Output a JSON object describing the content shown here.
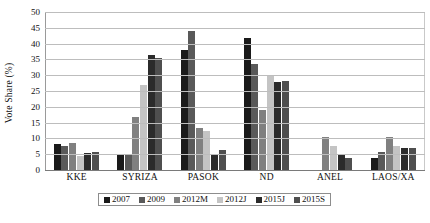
{
  "chart_data": {
    "type": "bar",
    "title": "",
    "subtitle": "",
    "xlabel": "",
    "ylabel": "Vote Share (%)",
    "ylim": [
      0,
      50
    ],
    "ytick_step": 5,
    "yticks": [
      "50",
      "45",
      "40",
      "35",
      "30",
      "25",
      "20",
      "15",
      "10",
      "5",
      "0"
    ],
    "grid": "horizontal",
    "legend_position": "bottom",
    "categories": [
      "KKE",
      "SYRIZA",
      "PASOK",
      "ND",
      "ANEL",
      "LAOS/XA"
    ],
    "series": [
      {
        "name": "2007",
        "color": "#1a1a1a",
        "values": [
          8.2,
          5.0,
          38.1,
          41.8,
          0.0,
          3.8
        ]
      },
      {
        "name": "2009",
        "color": "#595959",
        "values": [
          7.5,
          4.6,
          43.9,
          33.5,
          0.0,
          5.6
        ]
      },
      {
        "name": "2012M",
        "color": "#808080",
        "values": [
          8.5,
          16.8,
          13.2,
          18.9,
          10.6,
          10.6
        ]
      },
      {
        "name": "2012J",
        "color": "#c4c4c4",
        "values": [
          4.5,
          26.9,
          12.3,
          29.7,
          7.5,
          7.5
        ]
      },
      {
        "name": "2015J",
        "color": "#2b2b2b",
        "values": [
          5.5,
          36.3,
          4.7,
          27.8,
          4.8,
          6.9
        ]
      },
      {
        "name": "2015S",
        "color": "#4f4f4f",
        "values": [
          5.6,
          35.5,
          6.3,
          28.1,
          3.7,
          7.0
        ]
      }
    ]
  }
}
